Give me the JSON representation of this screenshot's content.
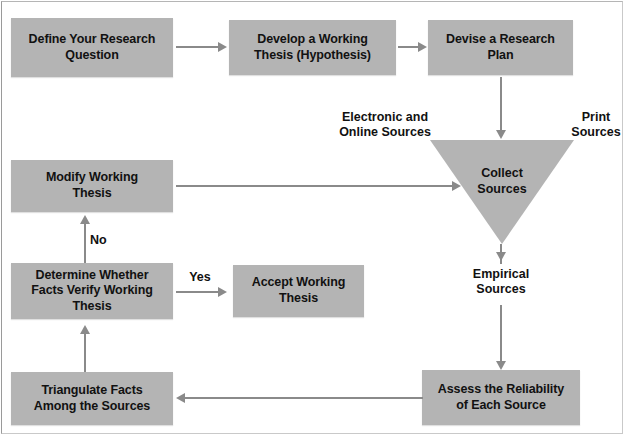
{
  "diagram": {
    "colors": {
      "node_fill": "#b4b4b4",
      "connector": "#8a8a8a",
      "text": "#111111",
      "background": "#ffffff"
    },
    "nodes": {
      "define_question": "Define Your Research\nQuestion",
      "develop_thesis": "Develop a Working\nThesis (Hypothesis)",
      "devise_plan": "Devise a Research\nPlan",
      "collect_sources": "Collect\nSources",
      "modify_thesis": "Modify Working\nThesis",
      "determine_verify": "Determine Whether\nFacts Verify Working\nThesis",
      "accept_thesis": "Accept Working\nThesis",
      "triangulate_facts": "Triangulate Facts\nAmong the Sources",
      "assess_reliability": "Assess the Reliability\nof Each Source"
    },
    "captions": {
      "electronic_online": "Electronic and\nOnline Sources",
      "print": "Print\nSources",
      "empirical": "Empirical\nSources"
    },
    "edge_labels": {
      "no": "No",
      "yes": "Yes"
    }
  }
}
